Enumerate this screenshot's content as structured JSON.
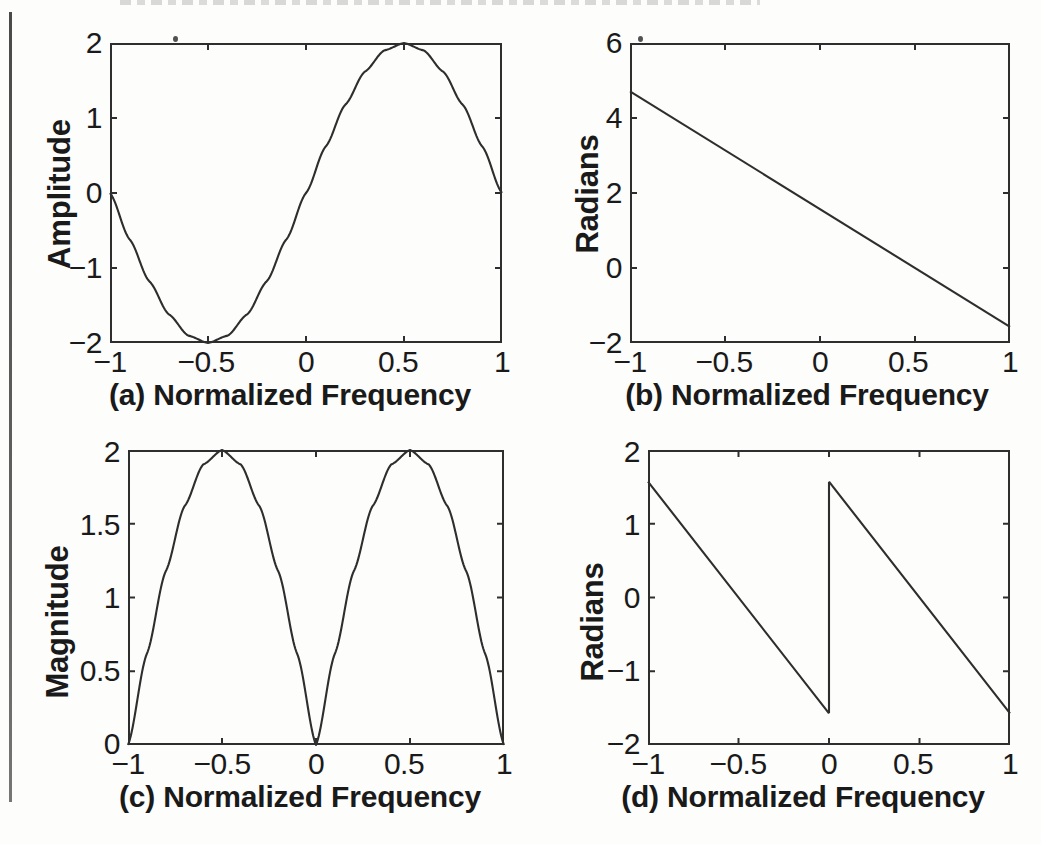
{
  "figure": {
    "panel_count": 4,
    "background_color": "#fdfdfc",
    "line_color": "#2e2e2e",
    "axis_color": "#2e2e2e"
  },
  "chart_data": [
    {
      "id": "a",
      "type": "line",
      "title": "",
      "xlabel": "(a) Normalized Frequency",
      "ylabel": "Amplitude",
      "xlim": [
        -1,
        1
      ],
      "ylim": [
        -2,
        2
      ],
      "xticks": [
        -1,
        -0.5,
        0,
        0.5,
        1
      ],
      "xticklabels": [
        "−1",
        "−0.5",
        "0",
        "0.5",
        "1"
      ],
      "yticks": [
        -2,
        -1,
        0,
        1,
        2
      ],
      "yticklabels": [
        "−2",
        "−1",
        "0",
        "1",
        "2"
      ],
      "grid": false,
      "legend": "none",
      "series": [
        {
          "name": "2 sin(pi f)",
          "description": "sinusoid, zero at f=-1, minimum -2 at f=-0.5, zero at f=0, maximum +2 at f=0.5, zero at f=1",
          "x": [
            -1,
            -0.9,
            -0.8,
            -0.7,
            -0.6,
            -0.5,
            -0.4,
            -0.3,
            -0.2,
            -0.1,
            0,
            0.1,
            0.2,
            0.3,
            0.4,
            0.5,
            0.6,
            0.7,
            0.8,
            0.9,
            1
          ],
          "y": [
            0,
            -0.618,
            -1.176,
            -1.618,
            -1.902,
            -2,
            -1.902,
            -1.618,
            -1.176,
            -0.618,
            0,
            0.618,
            1.176,
            1.618,
            1.902,
            2,
            1.902,
            1.618,
            1.176,
            0.618,
            0
          ]
        }
      ]
    },
    {
      "id": "b",
      "type": "line",
      "title": "",
      "xlabel": "(b) Normalized Frequency",
      "ylabel": "Radians",
      "xlim": [
        -1,
        1
      ],
      "ylim": [
        -2,
        6
      ],
      "xticks": [
        -1,
        -0.5,
        0,
        0.5,
        1
      ],
      "xticklabels": [
        "−1",
        "−0.5",
        "0",
        "0.5",
        "1"
      ],
      "yticks": [
        -2,
        0,
        2,
        4,
        6
      ],
      "yticklabels": [
        "−2",
        "0",
        "2",
        "4",
        "6"
      ],
      "grid": false,
      "legend": "none",
      "series": [
        {
          "name": "unwrapped phase",
          "description": "straight descending line from (-1, 4.712) to (1, -1.571)",
          "x": [
            -1,
            1
          ],
          "y": [
            4.712,
            -1.571
          ]
        }
      ]
    },
    {
      "id": "c",
      "type": "line",
      "title": "",
      "xlabel": "(c) Normalized Frequency",
      "ylabel": "Magnitude",
      "xlim": [
        -1,
        1
      ],
      "ylim": [
        0,
        2
      ],
      "xticks": [
        -1,
        -0.5,
        0,
        0.5,
        1
      ],
      "xticklabels": [
        "−1",
        "−0.5",
        "0",
        "0.5",
        "1"
      ],
      "yticks": [
        0,
        0.5,
        1,
        1.5,
        2
      ],
      "yticklabels": [
        "0",
        "0.5",
        "1",
        "1.5",
        "2"
      ],
      "grid": false,
      "legend": "none",
      "series": [
        {
          "name": "|2 sin(pi f)|",
          "description": "two rectified arches: zeros at f=-1, 0, 1 and peaks of 2 at f=-0.5 and f=+0.5",
          "x": [
            -1,
            -0.9,
            -0.8,
            -0.7,
            -0.6,
            -0.5,
            -0.4,
            -0.3,
            -0.2,
            -0.1,
            0,
            0.1,
            0.2,
            0.3,
            0.4,
            0.5,
            0.6,
            0.7,
            0.8,
            0.9,
            1
          ],
          "y": [
            0,
            0.618,
            1.176,
            1.618,
            1.902,
            2,
            1.902,
            1.618,
            1.176,
            0.618,
            0,
            0.618,
            1.176,
            1.618,
            1.902,
            2,
            1.902,
            1.618,
            1.176,
            0.618,
            0
          ]
        }
      ]
    },
    {
      "id": "d",
      "type": "line",
      "title": "",
      "xlabel": "(d) Normalized Frequency",
      "ylabel": "Radians",
      "xlim": [
        -1,
        1
      ],
      "ylim": [
        -2,
        2
      ],
      "xticks": [
        -1,
        -0.5,
        0,
        0.5,
        1
      ],
      "xticklabels": [
        "−1",
        "−0.5",
        "0",
        "0.5",
        "1"
      ],
      "yticks": [
        -2,
        -1,
        0,
        1,
        2
      ],
      "yticklabels": [
        "−2",
        "−1",
        "0",
        "1",
        "2"
      ],
      "grid": false,
      "legend": "none",
      "series": [
        {
          "name": "wrapped phase segment 1",
          "description": "descending ramp from (-1, 1.571) to (0, -1.571)",
          "x": [
            -1,
            0
          ],
          "y": [
            1.571,
            -1.571
          ]
        },
        {
          "name": "wrapped phase jump",
          "description": "vertical discontinuity at f=0 from -1.571 up to +1.571",
          "x": [
            0,
            0
          ],
          "y": [
            -1.571,
            1.571
          ]
        },
        {
          "name": "wrapped phase segment 2",
          "description": "descending ramp from (0, 1.571) to (1, -1.571)",
          "x": [
            0,
            1
          ],
          "y": [
            1.571,
            -1.571
          ]
        }
      ]
    }
  ]
}
